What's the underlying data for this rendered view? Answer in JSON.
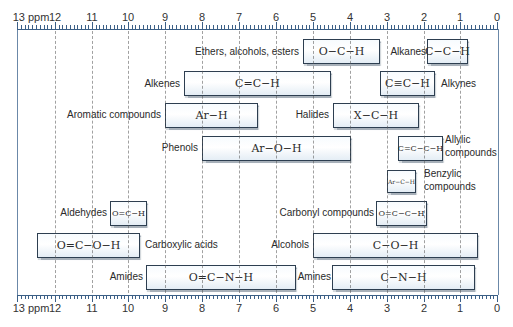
{
  "chart_data": {
    "type": "bar",
    "orientation": "horizontal-range",
    "title": "",
    "xlabel": "ppm",
    "ylabel": "",
    "xlim": [
      13,
      0
    ],
    "x_reversed": true,
    "grid": true,
    "x_ticks": [
      "13 ppm",
      "12",
      "11",
      "10",
      "9",
      "8",
      "7",
      "6",
      "5",
      "4",
      "3",
      "2",
      "1",
      "0"
    ],
    "series": [
      {
        "name": "Ethers, alcohols, esters",
        "structure": "O−C−H",
        "start": 5.3,
        "end": 3.2
      },
      {
        "name": "Alkanes",
        "structure": "C−C−H",
        "start": 1.9,
        "end": 0.8
      },
      {
        "name": "Alkenes",
        "structure": "C=C−H",
        "start": 8.5,
        "end": 4.5
      },
      {
        "name": "Alkynes",
        "structure": "C≡C−H",
        "start": 3.2,
        "end": 1.7
      },
      {
        "name": "Aromatic compounds",
        "structure": "Ar−H",
        "start": 9.0,
        "end": 6.5
      },
      {
        "name": "Halides",
        "structure": "X−C−H",
        "start": 4.5,
        "end": 2.1
      },
      {
        "name": "Phenols",
        "structure": "Ar−O−H",
        "start": 8.0,
        "end": 4.0
      },
      {
        "name": "Allylic compounds",
        "structure": "C=C−C−H",
        "start": 2.7,
        "end": 1.5
      },
      {
        "name": "Benzylic compounds",
        "structure": "Ar−C−H",
        "start": 3.0,
        "end": 2.2
      },
      {
        "name": "Carbonyl compounds",
        "structure": "O=C−C−H",
        "start": 3.3,
        "end": 1.9
      },
      {
        "name": "Aldehydes",
        "structure": "O=C−H",
        "start": 10.5,
        "end": 9.5
      },
      {
        "name": "Carboxylic acids",
        "structure": "O=C−O−H",
        "start": 12.5,
        "end": 9.7
      },
      {
        "name": "Alcohols",
        "structure": "C−O−H",
        "start": 5.0,
        "end": 0.5
      },
      {
        "name": "Amides",
        "structure": "O=C−N−H",
        "start": 9.5,
        "end": 5.4
      },
      {
        "name": "Amines",
        "structure": "C−N−H",
        "start": 4.5,
        "end": 0.6
      }
    ]
  },
  "axis": {
    "ticks": [
      {
        "label": "13 ppm",
        "x": 17
      },
      {
        "label": "12",
        "x": 55
      },
      {
        "label": "11",
        "x": 92
      },
      {
        "label": "10",
        "x": 128
      },
      {
        "label": "9",
        "x": 165
      },
      {
        "label": "8",
        "x": 202
      },
      {
        "label": "7",
        "x": 239
      },
      {
        "label": "6",
        "x": 276
      },
      {
        "label": "5",
        "x": 313
      },
      {
        "label": "4",
        "x": 350
      },
      {
        "label": "3",
        "x": 387
      },
      {
        "label": "2",
        "x": 424
      },
      {
        "label": "1",
        "x": 460
      },
      {
        "label": "0",
        "x": 497
      }
    ]
  },
  "bars": {
    "ethers": {
      "label": "Ethers, alcohols, esters",
      "structure": "O−C−H"
    },
    "alkanes": {
      "label": "Alkanes",
      "structure": "C−C−H"
    },
    "alkenes": {
      "label": "Alkenes",
      "structure": "C=C−H"
    },
    "alkynes": {
      "label": "Alkynes",
      "structure": "C≡C−H"
    },
    "aromatic": {
      "label": "Aromatic compounds",
      "structure": "Ar−H"
    },
    "halides": {
      "label": "Halides",
      "structure": "X−C−H"
    },
    "phenols": {
      "label": "Phenols",
      "structure": "Ar−O−H"
    },
    "allylic": {
      "label1": "Allylic",
      "label2": "compounds",
      "structure": "C=C−C−H"
    },
    "benzylic": {
      "label1": "Benzylic",
      "label2": "compounds",
      "structure": "Ar−C−H"
    },
    "carbonyl": {
      "label": "Carbonyl compounds",
      "structure": "O=C−C−H"
    },
    "aldehydes": {
      "label": "Aldehydes",
      "structure": "O=C−H"
    },
    "carboxylic": {
      "label": "Carboxylic acids",
      "structure": "O=C−O−H"
    },
    "alcohols": {
      "label": "Alcohols",
      "structure": "C−O−H"
    },
    "amides": {
      "label": "Amides",
      "structure": "O=C−N−H"
    },
    "amines": {
      "label": "Amines",
      "structure": "C−N−H"
    }
  }
}
